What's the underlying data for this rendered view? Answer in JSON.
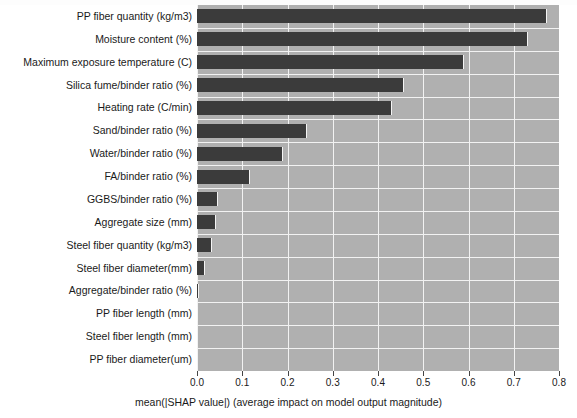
{
  "chart_data": {
    "type": "bar",
    "orientation": "horizontal",
    "title": "",
    "subtitle": "",
    "xlabel": "mean(|SHAP value|) (average impact on model output magnitude)",
    "ylabel": "",
    "xlim": [
      0.0,
      0.8
    ],
    "xticks": [
      "0.0",
      "0.1",
      "0.2",
      "0.3",
      "0.4",
      "0.5",
      "0.6",
      "0.7",
      "0.8"
    ],
    "xtick_values": [
      0.0,
      0.1,
      0.2,
      0.3,
      0.4,
      0.5,
      0.6,
      0.7,
      0.8
    ],
    "grid": true,
    "legend": "none",
    "bar_color": "#3b3b3b",
    "plot_background": "#b0b0b0",
    "grid_color": "#f2f2f2",
    "categories": [
      "PP fiber quantity (kg/m3)",
      "Moisture content (%)",
      "Maximum exposure temperature (C)",
      "Silica fume/binder ratio (%)",
      "Heating rate (C/min)",
      "Sand/binder ratio (%)",
      "Water/binder ratio (%)",
      "FA/binder ratio (%)",
      "GGBS/binder ratio (%)",
      "Aggregate size (mm)",
      "Steel fiber quantity (kg/m3)",
      "Steel fiber diameter(mm)",
      "Aggregate/binder ratio (%)",
      "PP fiber length (mm)",
      "Steel fiber length (mm)",
      "PP fiber diameter(um)"
    ],
    "values": [
      0.773,
      0.731,
      0.591,
      0.458,
      0.431,
      0.242,
      0.189,
      0.118,
      0.047,
      0.042,
      0.034,
      0.017,
      0.004,
      0.003,
      0.0,
      0.0
    ]
  }
}
